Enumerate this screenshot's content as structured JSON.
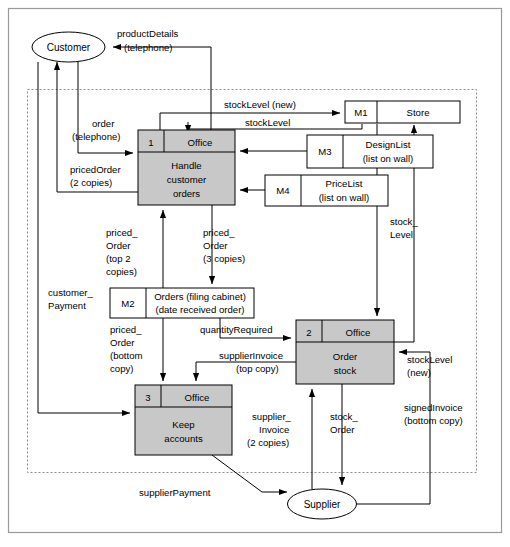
{
  "diagram": {
    "type": "data-flow-diagram",
    "title": "",
    "external_entities": [
      {
        "id": "customer",
        "label": "Customer",
        "x": 68,
        "y": 47
      },
      {
        "id": "supplier",
        "label": "Supplier",
        "x": 322,
        "y": 504
      }
    ],
    "processes": [
      {
        "id": "p1",
        "number": "1",
        "location": "Office",
        "name_lines": [
          "Handle",
          "customer",
          "orders"
        ],
        "x": 138,
        "y": 130,
        "w": 97,
        "h": 75
      },
      {
        "id": "p2",
        "number": "2",
        "location": "Office",
        "name_lines": [
          "Order",
          "stock"
        ],
        "x": 296,
        "y": 320,
        "w": 98,
        "h": 64
      },
      {
        "id": "p3",
        "number": "3",
        "location": "Office",
        "name_lines": [
          "Keep",
          "accounts"
        ],
        "x": 135,
        "y": 385,
        "w": 97,
        "h": 70
      }
    ],
    "data_stores": [
      {
        "id": "m1",
        "code": "M1",
        "name_lines": [
          "Store"
        ],
        "x": 345,
        "y": 101,
        "w": 115,
        "h": 22,
        "divider": 32
      },
      {
        "id": "m3",
        "code": "M3",
        "name_lines": [
          "DesignList",
          "(list on wall)"
        ],
        "x": 307,
        "y": 135,
        "w": 126,
        "h": 33,
        "divider": 36
      },
      {
        "id": "m4",
        "code": "M4",
        "name_lines": [
          "PriceList",
          "(list on wall)"
        ],
        "x": 265,
        "y": 175,
        "w": 123,
        "h": 31,
        "divider": 36
      },
      {
        "id": "m2",
        "code": "M2",
        "name_lines": [
          "Orders (filing cabinet)",
          "(date received order)"
        ],
        "x": 110,
        "y": 288,
        "w": 144,
        "h": 30,
        "divider": 36
      }
    ],
    "flows": [
      {
        "id": "f-product-details",
        "lines": [
          "productDetails",
          "(telephone)"
        ],
        "from": "p1",
        "to": "customer"
      },
      {
        "id": "f-order",
        "lines": [
          "order",
          "(telephone)"
        ],
        "from": "customer",
        "to": "p1"
      },
      {
        "id": "f-priced-order-2copies",
        "lines": [
          "pricedOrder",
          "(2 copies)"
        ],
        "from": "p1",
        "to": "customer"
      },
      {
        "id": "f-stocklevel-new-top",
        "lines": [
          "stockLevel (new)"
        ],
        "from": "p1",
        "to": "m1"
      },
      {
        "id": "f-stocklevel",
        "lines": [
          "stockLevel"
        ],
        "from": "m1",
        "to": "p1"
      },
      {
        "id": "f-designlist",
        "lines": [],
        "from": "m3",
        "to": "p1"
      },
      {
        "id": "f-pricelist",
        "lines": [],
        "from": "m4",
        "to": "p1"
      },
      {
        "id": "f-priced-order-top2",
        "lines": [
          "priced_",
          "Order",
          "(top 2",
          "copies)"
        ],
        "from": "m2",
        "to": "p1"
      },
      {
        "id": "f-priced-order-3copies",
        "lines": [
          "priced_",
          "Order",
          "(3 copies)"
        ],
        "from": "p1",
        "to": "m2"
      },
      {
        "id": "f-customer-payment",
        "lines": [
          "customer_",
          "Payment"
        ],
        "from": "customer",
        "to": "p3"
      },
      {
        "id": "f-priced-order-bottom",
        "lines": [
          "priced_",
          "Order",
          "(bottom",
          "copy)"
        ],
        "from": "m2",
        "to": "p3"
      },
      {
        "id": "f-quantity-required",
        "lines": [
          "quantityRequired"
        ],
        "from": "m2",
        "to": "p2"
      },
      {
        "id": "f-supplier-invoice-top",
        "lines": [
          "supplierInvoice",
          "(top copy)"
        ],
        "from": "p2",
        "to": "p3"
      },
      {
        "id": "f-stock-level-right",
        "lines": [
          "stock_",
          "Level"
        ],
        "from": "m1",
        "to": "p2"
      },
      {
        "id": "f-stocklevel-new-right",
        "lines": [
          "stockLevel",
          "(new)"
        ],
        "from": "p2",
        "to": "m1"
      },
      {
        "id": "f-supplier-invoice-2copies",
        "lines": [
          "supplier_",
          "Invoice",
          "(2 copies)"
        ],
        "from": "supplier",
        "to": "p2"
      },
      {
        "id": "f-stock-order",
        "lines": [
          "stock_",
          "Order"
        ],
        "from": "p2",
        "to": "supplier"
      },
      {
        "id": "f-signed-invoice",
        "lines": [
          "signedInvoice",
          "(bottom copy)"
        ],
        "from": "supplier",
        "to": "p2"
      },
      {
        "id": "f-supplier-payment",
        "lines": [
          "supplierPayment"
        ],
        "from": "p3",
        "to": "supplier"
      }
    ],
    "system_boundary": {
      "x": 27,
      "y": 89,
      "w": 450,
      "h": 383
    },
    "outer_frame": {
      "x": 8,
      "y": 8,
      "w": 494,
      "h": 525
    },
    "colors": {
      "process_fill": "#c8c8c8",
      "store_fill": "#ffffff",
      "line": "#000000",
      "boundary": "#8c8c8c",
      "frame": "#9a9a9a"
    }
  },
  "labels": {
    "productDetails": "productDetails",
    "productDetails_2": "(telephone)",
    "order": "order",
    "order_2": "(telephone)",
    "pricedOrder": "pricedOrder",
    "pricedOrder_2": "(2 copies)",
    "stockLevelNew": "stockLevel (new)",
    "stockLevel": "stockLevel",
    "pricedOrderTop2_1": "priced_",
    "pricedOrderTop2_2": "Order",
    "pricedOrderTop2_3": "(top 2",
    "pricedOrderTop2_4": "copies)",
    "pricedOrder3_1": "priced_",
    "pricedOrder3_2": "Order",
    "pricedOrder3_3": "(3 copies)",
    "customerPayment_1": "customer_",
    "customerPayment_2": "Payment",
    "pricedOrderBottom_1": "priced_",
    "pricedOrderBottom_2": "Order",
    "pricedOrderBottom_3": "(bottom",
    "pricedOrderBottom_4": "copy)",
    "quantityRequired": "quantityRequired",
    "supplierInvoiceTop_1": "supplierInvoice",
    "supplierInvoiceTop_2": "(top copy)",
    "stockLevelRight_1": "stock_",
    "stockLevelRight_2": "Level",
    "stockLevelNewRight_1": "stockLevel",
    "stockLevelNewRight_2": "(new)",
    "supplierInvoice2_1": "supplier_",
    "supplierInvoice2_2": "Invoice",
    "supplierInvoice2_3": "(2 copies)",
    "stockOrder_1": "stock_",
    "stockOrder_2": "Order",
    "signedInvoice_1": "signedInvoice",
    "signedInvoice_2": "(bottom copy)",
    "supplierPayment": "supplierPayment",
    "customer": "Customer",
    "supplier": "Supplier",
    "office": "Office",
    "p1_num": "1",
    "p1_l1": "Handle",
    "p1_l2": "customer",
    "p1_l3": "orders",
    "p2_num": "2",
    "p2_l1": "Order",
    "p2_l2": "stock",
    "p3_num": "3",
    "p3_l1": "Keep",
    "p3_l2": "accounts",
    "m1_code": "M1",
    "m1_name": "Store",
    "m3_code": "M3",
    "m3_l1": "DesignList",
    "m3_l2": "(list on wall)",
    "m4_code": "M4",
    "m4_l1": "PriceList",
    "m4_l2": "(list on wall)",
    "m2_code": "M2",
    "m2_l1": "Orders (filing cabinet)",
    "m2_l2": "(date received order)"
  }
}
